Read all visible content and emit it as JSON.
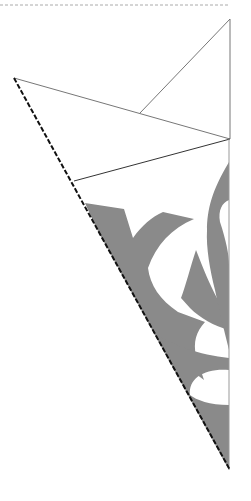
{
  "diagram": {
    "colors": {
      "background": "#ffffff",
      "cutout_fill": "#8a8a8a",
      "fold_line": "#777777",
      "outline": "#555555",
      "cut_edge_dashed": "#111111",
      "top_dashed": "#aaaaaa"
    },
    "elements": [
      "top dashed guide line",
      "folded paper upper flaps",
      "dashed diagonal cut/fold edge",
      "gray cutout pattern",
      "right vertical fold edge"
    ]
  }
}
